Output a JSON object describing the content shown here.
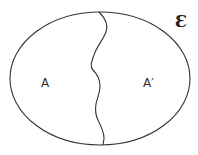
{
  "diagram": {
    "universal_set_label": "Ɛ",
    "regions": [
      {
        "label": "A"
      },
      {
        "label": "A′"
      }
    ],
    "colors": {
      "stroke": "#333333",
      "background": "#ffffff"
    }
  }
}
